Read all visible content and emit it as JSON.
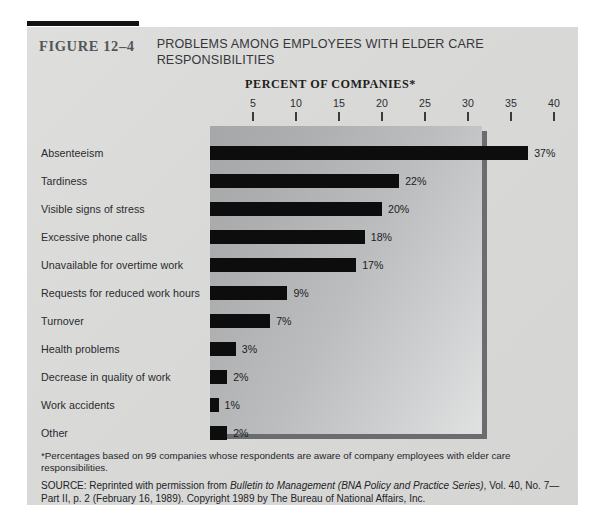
{
  "figure": {
    "number": "FIGURE 12–4",
    "title": "PROBLEMS AMONG EMPLOYEES WITH ELDER CARE RESPONSIBILITIES"
  },
  "footnote": "*Percentages based on 99 companies whose respondents are aware of company employees with elder care responsibilities.",
  "source": {
    "prefix": "SOURCE: Reprinted with permission from ",
    "italic": "Bulletin to Management (BNA Policy and Practice Series)",
    "suffix": ", Vol. 40, No. 7—Part II, p. 2 (February 16, 1989). Copyright 1989 by The Bureau of National Affairs, Inc."
  },
  "chart_data": {
    "type": "bar",
    "orientation": "horizontal",
    "title": "PERCENT OF COMPANIES*",
    "xlabel": "PERCENT OF COMPANIES*",
    "ylabel": "",
    "xlim": [
      0,
      42
    ],
    "grid": false,
    "legend": "none",
    "ticks": [
      5,
      10,
      15,
      20,
      25,
      30,
      35,
      40
    ],
    "categories": [
      "Absenteeism",
      "Tardiness",
      "Visible signs of stress",
      "Excessive phone calls",
      "Unavailable for overtime work",
      "Requests for reduced work hours",
      "Turnover",
      "Health problems",
      "Decrease in quality of work",
      "Work accidents",
      "Other"
    ],
    "values": [
      37,
      22,
      20,
      18,
      17,
      9,
      7,
      3,
      2,
      1,
      2
    ],
    "value_labels": [
      "37%",
      "22%",
      "20%",
      "18%",
      "17%",
      "9%",
      "7%",
      "3%",
      "2%",
      "1%",
      "2%"
    ],
    "bar_color": "#0d0d0e"
  }
}
